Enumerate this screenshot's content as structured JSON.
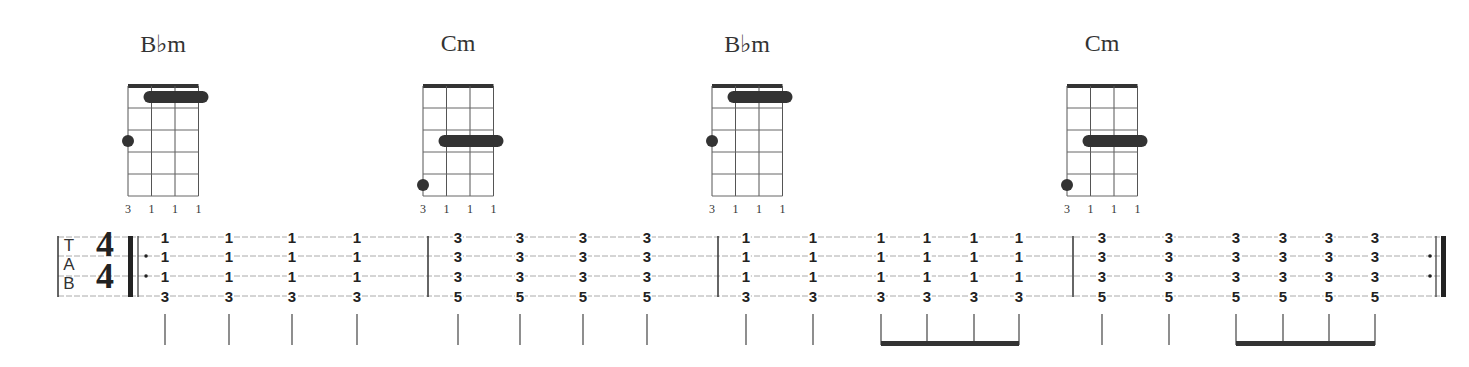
{
  "chords": [
    {
      "name": "B♭m",
      "x": 163,
      "fingers": [
        "3",
        "1",
        "1",
        "1"
      ],
      "bar_fret": 1,
      "dot": {
        "string": 0,
        "fret": 3
      }
    },
    {
      "name": "Cm",
      "x": 458,
      "fingers": [
        "3",
        "1",
        "1",
        "1"
      ],
      "bar_fret": 3,
      "dot": {
        "string": 0,
        "fret": 5
      }
    },
    {
      "name": "B♭m",
      "x": 747,
      "fingers": [
        "3",
        "1",
        "1",
        "1"
      ],
      "bar_fret": 1,
      "dot": {
        "string": 0,
        "fret": 3
      }
    },
    {
      "name": "Cm",
      "x": 1102,
      "fingers": [
        "3",
        "1",
        "1",
        "1"
      ],
      "bar_fret": 3,
      "dot": {
        "string": 0,
        "fret": 5
      }
    }
  ],
  "tab": {
    "clef": [
      "T",
      "A",
      "B"
    ],
    "time_signature": {
      "top": "4",
      "bottom": "4"
    },
    "measures": [
      {
        "beats": [
          {
            "x": 165,
            "frets": [
              "1",
              "1",
              "1",
              "3"
            ]
          },
          {
            "x": 229,
            "frets": [
              "1",
              "1",
              "1",
              "3"
            ]
          },
          {
            "x": 292,
            "frets": [
              "1",
              "1",
              "1",
              "3"
            ]
          },
          {
            "x": 357,
            "frets": [
              "1",
              "1",
              "1",
              "3"
            ]
          }
        ]
      },
      {
        "beats": [
          {
            "x": 458,
            "frets": [
              "3",
              "3",
              "3",
              "5"
            ]
          },
          {
            "x": 520,
            "frets": [
              "3",
              "3",
              "3",
              "5"
            ]
          },
          {
            "x": 583,
            "frets": [
              "3",
              "3",
              "3",
              "5"
            ]
          },
          {
            "x": 647,
            "frets": [
              "3",
              "3",
              "3",
              "5"
            ]
          }
        ]
      },
      {
        "beats": [
          {
            "x": 746,
            "frets": [
              "1",
              "1",
              "1",
              "3"
            ]
          },
          {
            "x": 813,
            "frets": [
              "1",
              "1",
              "1",
              "3"
            ]
          },
          {
            "x": 881,
            "frets": [
              "1",
              "1",
              "1",
              "3"
            ]
          },
          {
            "x": 927,
            "frets": [
              "1",
              "1",
              "1",
              "3"
            ]
          },
          {
            "x": 974,
            "frets": [
              "1",
              "1",
              "1",
              "3"
            ]
          },
          {
            "x": 1019,
            "frets": [
              "1",
              "1",
              "1",
              "3"
            ]
          }
        ]
      },
      {
        "beats": [
          {
            "x": 1102,
            "frets": [
              "3",
              "3",
              "3",
              "5"
            ]
          },
          {
            "x": 1169,
            "frets": [
              "3",
              "3",
              "3",
              "5"
            ]
          },
          {
            "x": 1236,
            "frets": [
              "3",
              "3",
              "3",
              "5"
            ]
          },
          {
            "x": 1283,
            "frets": [
              "3",
              "3",
              "3",
              "5"
            ]
          },
          {
            "x": 1329,
            "frets": [
              "3",
              "3",
              "3",
              "5"
            ]
          },
          {
            "x": 1375,
            "frets": [
              "3",
              "3",
              "3",
              "5"
            ]
          }
        ]
      }
    ],
    "beams": [
      {
        "x1": 881,
        "x2": 1019
      },
      {
        "x1": 1236,
        "x2": 1375
      }
    ]
  }
}
